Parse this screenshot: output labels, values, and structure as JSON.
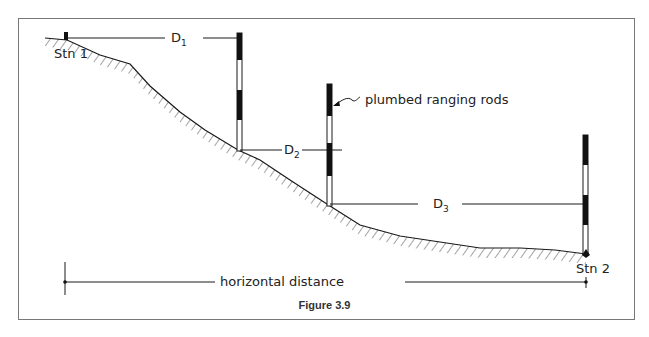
{
  "figure": {
    "caption": "Figure 3.9",
    "labels": {
      "stn1": "Stn 1",
      "stn2": "Stn 2",
      "d1": "D",
      "d1_sub": "1",
      "d2": "D",
      "d2_sub": "2",
      "d3": "D",
      "d3_sub": "3",
      "rods": "plumbed ranging rods",
      "horizontal": "horizontal distance"
    },
    "colors": {
      "line": "#1a1a1a",
      "frame": "#777777"
    }
  }
}
